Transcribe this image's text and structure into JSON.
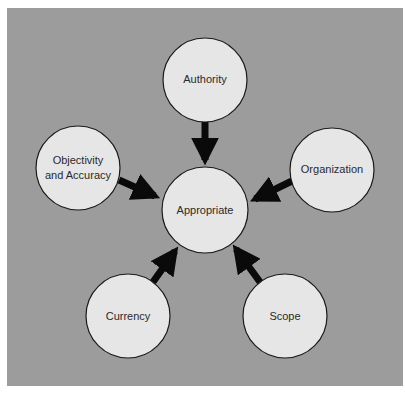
{
  "heading": {
    "text": "Figure: Five criteria for determining whether a source is appropriate for your research",
    "visible_fragment": "g        ppr p    y"
  },
  "colors": {
    "background": "#9c9c9c",
    "node_fill": "#e6e6e6",
    "node_stroke": "#1a1a1a",
    "arrow": "#0a0a0a"
  },
  "diagram": {
    "center_node": {
      "label": "Appropriate",
      "cx": 205,
      "cy": 210,
      "r": 43
    },
    "outer_nodes": [
      {
        "id": "authority",
        "lines": [
          "Authority"
        ],
        "cx": 205,
        "cy": 80,
        "r": 42
      },
      {
        "id": "organization",
        "lines": [
          "Organization"
        ],
        "cx": 332,
        "cy": 170,
        "r": 42
      },
      {
        "id": "scope",
        "lines": [
          "Scope"
        ],
        "cx": 285,
        "cy": 316,
        "r": 42
      },
      {
        "id": "currency",
        "lines": [
          "Currency"
        ],
        "cx": 128,
        "cy": 316,
        "r": 42
      },
      {
        "id": "objectivity",
        "lines": [
          "Objectivity",
          "and Accuracy"
        ],
        "cx": 78,
        "cy": 168,
        "r": 42
      }
    ],
    "edges": [
      {
        "from": "authority",
        "to": "Appropriate"
      },
      {
        "from": "organization",
        "to": "Appropriate"
      },
      {
        "from": "scope",
        "to": "Appropriate"
      },
      {
        "from": "currency",
        "to": "Appropriate"
      },
      {
        "from": "objectivity",
        "to": "Appropriate"
      }
    ]
  }
}
